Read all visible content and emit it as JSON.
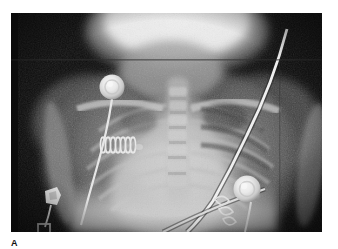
{
  "figure": {
    "caption_label": "A",
    "modality": "radiograph",
    "view": "anteroposterior-chest",
    "plate": {
      "x": 11,
      "y": 13,
      "width": 311,
      "height": 219,
      "background_hex": "#050505",
      "border_hex": "#ffffff"
    },
    "tones": {
      "background_black_hex": "#050505",
      "soft_tissue_dark_hex": "#2a2a2a",
      "lung_mid_hex": "#6e6e6e",
      "mediastinum_hex": "#b9b9b9",
      "bone_bright_hex": "#d8d8d8",
      "metal_white_hex": "#f4f4f4",
      "skull_white_hex": "#ececec"
    }
  },
  "anatomy": [
    {
      "id": "skull-occiput",
      "label": "Skull / occiput",
      "cx": 168,
      "cy": 20,
      "rx": 86,
      "ry": 44,
      "tone": "#e8e8e8"
    },
    {
      "id": "neck-soft-tissue",
      "label": "Neck soft tissue",
      "cx": 160,
      "cy": 62,
      "rx": 54,
      "ry": 30,
      "tone": "#9a9a9a"
    },
    {
      "id": "mediastinum-heart",
      "label": "Mediastinum and cardiac silhouette",
      "cx": 170,
      "cy": 150,
      "rx": 76,
      "ry": 72,
      "tone": "#c2c2c2"
    },
    {
      "id": "thoracic-spine",
      "label": "Thoracic spine",
      "cx": 168,
      "cy": 135,
      "rx": 12,
      "ry": 90,
      "tone": "#c8c8c8"
    },
    {
      "id": "right-lung",
      "label": "Right lung field",
      "cx": 110,
      "cy": 140,
      "rx": 52,
      "ry": 68,
      "tone": "#707070"
    },
    {
      "id": "left-lung",
      "label": "Left lung field",
      "cx": 235,
      "cy": 140,
      "rx": 54,
      "ry": 70,
      "tone": "#6a6a6a"
    },
    {
      "id": "right-humerus",
      "label": "Right humerus",
      "cx": 52,
      "cy": 140,
      "rx": 13,
      "ry": 72,
      "tone": "#7a7a7a"
    },
    {
      "id": "left-humerus",
      "label": "Left humerus",
      "cx": 300,
      "cy": 150,
      "rx": 14,
      "ry": 70,
      "tone": "#7a7a7a"
    },
    {
      "id": "right-clavicle",
      "label": "Right clavicle",
      "tone": "#cfcfcf"
    },
    {
      "id": "left-clavicle",
      "label": "Left clavicle",
      "tone": "#cfcfcf"
    },
    {
      "id": "rib-cage",
      "label": "Rib cage",
      "rib_pairs": 8,
      "tone": "#b4b4b4"
    },
    {
      "id": "diaphragm",
      "label": "Diaphragm / abdomen",
      "tone": "#d2d2d2"
    }
  ],
  "devices": [
    {
      "id": "ecg-electrode-upper-right",
      "label": "ECG electrode (upper right chest)",
      "cx": 101,
      "cy": 74,
      "r": 12,
      "tone": "#f2f2f2"
    },
    {
      "id": "ecg-electrode-lower-left",
      "label": "ECG electrode (lower left chest)",
      "cx": 247,
      "cy": 189,
      "r": 13,
      "tone": "#f0f0f0"
    },
    {
      "id": "electrode-lead-wire-right",
      "label": "Electrode lead wire (right)",
      "tone": "#e6e6e6"
    },
    {
      "id": "electrode-lead-wire-left",
      "label": "Electrode lead wire (left)",
      "tone": "#e6e6e6"
    },
    {
      "id": "coiled-wire-artifact",
      "label": "Coiled wire / spring artifact overlying right hemithorax",
      "cx": 108,
      "cy": 130,
      "coils": 7,
      "tone": "#ededed"
    },
    {
      "id": "metallic-clip",
      "label": "Metallic clip / fastener at lower right field",
      "cx": 41,
      "cy": 188,
      "tone": "#f4f4f4"
    },
    {
      "id": "catheter-tube-diagonal",
      "label": "Radiopaque catheter / tubing crossing from upper left to lower right",
      "tone": "#f6f6f6"
    },
    {
      "id": "lower-tubing-segment",
      "label": "Lower tubing segment crossing left costophrenic region",
      "tone": "#dcdcdc"
    },
    {
      "id": "bracket-artifact-bottom",
      "label": "Rectangular bracket artifact at lower border",
      "tone": "#cfcfcf"
    }
  ]
}
